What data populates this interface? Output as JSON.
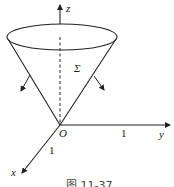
{
  "figure": {
    "caption": "图 11-37",
    "surface_label": "Σ",
    "origin_label": "O",
    "axes": {
      "x": {
        "label": "x",
        "tick": "1"
      },
      "y": {
        "label": "y",
        "tick": "1"
      },
      "z": {
        "label": "z"
      }
    },
    "colors": {
      "stroke": "#222222",
      "background": "#ffffff"
    }
  }
}
